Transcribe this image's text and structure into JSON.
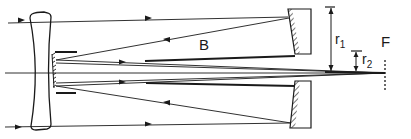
{
  "diagram": {
    "type": "optical-ray-diagram",
    "labels": {
      "b": "B",
      "r1_main": "r",
      "r1_sub": "1",
      "r2_main": "r",
      "r2_sub": "2",
      "f": "F"
    },
    "components": [
      "meniscus-corrector-lens",
      "secondary-mirror-hatched",
      "baffle-tube",
      "annular-primary-mirror-top",
      "annular-primary-mirror-bottom",
      "optical-axis",
      "focal-plane"
    ],
    "colors": {
      "line": "#1a1a1a",
      "background": "#ffffff"
    }
  }
}
